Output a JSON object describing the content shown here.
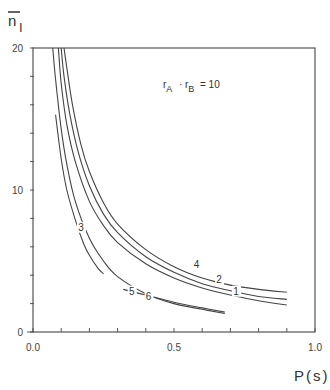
{
  "chart_data": {
    "type": "line",
    "title": "",
    "xlabel": "P(s)",
    "ylabel": "n̄_I",
    "xlim": [
      0.0,
      1.0
    ],
    "ylim": [
      0,
      20
    ],
    "x_ticks": [
      0.0,
      0.5,
      1.0
    ],
    "x_tick_labels": [
      "0.0",
      "0.5",
      "1.0"
    ],
    "x_minor_step": 0.1,
    "y_ticks": [
      0,
      10,
      20
    ],
    "y_tick_labels": [
      "0",
      "10",
      "20"
    ],
    "y_minor_step": 2,
    "grid": false,
    "frame": "box",
    "annotation": {
      "text_main": "r",
      "sub_a": "A",
      "dot": "·",
      "text_b": "r",
      "sub_b": "B",
      "rhs": "= 10",
      "x": 0.6,
      "y": 17.8
    },
    "series": [
      {
        "name": "1",
        "label_pos": [
          0.72,
          2.7
        ],
        "x": [
          0.09,
          0.1,
          0.12,
          0.15,
          0.2,
          0.25,
          0.3,
          0.4,
          0.5,
          0.6,
          0.7,
          0.8,
          0.9
        ],
        "y": [
          20.0,
          17.5,
          14.6,
          12.0,
          9.2,
          7.5,
          6.3,
          4.8,
          3.8,
          3.1,
          2.6,
          2.2,
          1.9
        ]
      },
      {
        "name": "2",
        "label_pos": [
          0.66,
          3.5
        ],
        "x": [
          0.1,
          0.11,
          0.13,
          0.16,
          0.2,
          0.25,
          0.3,
          0.4,
          0.5,
          0.6,
          0.7,
          0.8,
          0.9
        ],
        "y": [
          20.0,
          18.0,
          15.4,
          12.7,
          10.3,
          8.3,
          7.0,
          5.3,
          4.2,
          3.4,
          2.9,
          2.5,
          2.3
        ]
      },
      {
        "name": "4",
        "label_pos": [
          0.58,
          4.6
        ],
        "x": [
          0.11,
          0.12,
          0.14,
          0.17,
          0.2,
          0.25,
          0.3,
          0.4,
          0.5,
          0.6,
          0.7,
          0.8,
          0.9
        ],
        "y": [
          20.0,
          18.6,
          16.0,
          13.2,
          11.3,
          9.1,
          7.6,
          5.8,
          4.6,
          3.8,
          3.3,
          3.0,
          2.8
        ]
      },
      {
        "name": "5",
        "label_pos": [
          0.35,
          2.7
        ],
        "x": [
          0.07,
          0.08,
          0.1,
          0.12,
          0.15,
          0.2,
          0.25,
          0.3,
          0.4,
          0.5,
          0.6,
          0.68
        ],
        "y": [
          20.0,
          17.8,
          14.3,
          11.8,
          9.2,
          6.6,
          5.0,
          3.9,
          2.7,
          2.0,
          1.6,
          1.3
        ]
      },
      {
        "name": "3",
        "label_pos": [
          0.17,
          7.2
        ],
        "x": [
          0.08,
          0.1,
          0.12,
          0.15,
          0.18,
          0.2,
          0.23,
          0.25
        ],
        "y": [
          15.3,
          12.2,
          10.0,
          7.9,
          6.2,
          5.4,
          4.5,
          4.1
        ]
      },
      {
        "name": "6",
        "label_pos": [
          0.41,
          2.3
        ],
        "x": [
          0.32,
          0.4,
          0.5,
          0.6,
          0.68
        ],
        "y": [
          3.0,
          2.6,
          2.1,
          1.7,
          1.4
        ]
      }
    ]
  },
  "ui": {
    "y_axis_title_main": "n",
    "y_axis_title_sub": "I",
    "x_axis_title": "P(s)"
  }
}
